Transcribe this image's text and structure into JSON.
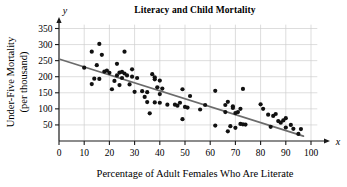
{
  "chart_data": {
    "type": "scatter",
    "title": "Literacy and Child Mortality",
    "xlabel": "Percentage of Adult Females Who Are Literate",
    "ylabel": "Under-Five Mortality (per thousand)",
    "ylabel_line1": "Under-Five Mortality",
    "ylabel_line2": "(per thousand)",
    "x_axis_name": "x",
    "y_axis_name": "y",
    "xlim": [
      0,
      103
    ],
    "ylim": [
      0,
      365
    ],
    "xticks": [
      0,
      10,
      20,
      30,
      40,
      50,
      60,
      70,
      80,
      90,
      100
    ],
    "yticks": [
      50,
      100,
      150,
      200,
      250,
      300,
      350
    ],
    "grid": true,
    "grid_color": "#cfcfcf",
    "point_color": "#111111",
    "point_radius": 2.1,
    "axis_color": "#1a1a1a",
    "trendline": {
      "label": "least-squares regression line",
      "color": "#6b6b6b",
      "x_start": 0,
      "y_start": 255,
      "x_end": 97,
      "y_end": 15
    },
    "points": [
      [
        10,
        228
      ],
      [
        13,
        278
      ],
      [
        13,
        177
      ],
      [
        14,
        194
      ],
      [
        15,
        236
      ],
      [
        16,
        302
      ],
      [
        16,
        193
      ],
      [
        17,
        268
      ],
      [
        18,
        216
      ],
      [
        19,
        219
      ],
      [
        20,
        212
      ],
      [
        21,
        161
      ],
      [
        22,
        187
      ],
      [
        23,
        240
      ],
      [
        23,
        204
      ],
      [
        24,
        213
      ],
      [
        24,
        174
      ],
      [
        25,
        215
      ],
      [
        25,
        196
      ],
      [
        26,
        278
      ],
      [
        26,
        210
      ],
      [
        27,
        204
      ],
      [
        28,
        176
      ],
      [
        29,
        223
      ],
      [
        29,
        200
      ],
      [
        30,
        153
      ],
      [
        31,
        196
      ],
      [
        33,
        155
      ],
      [
        34,
        137
      ],
      [
        35,
        152
      ],
      [
        35,
        121
      ],
      [
        36,
        86
      ],
      [
        37,
        208
      ],
      [
        38,
        198
      ],
      [
        38,
        192
      ],
      [
        38,
        120
      ],
      [
        39,
        167
      ],
      [
        40,
        188
      ],
      [
        40,
        146
      ],
      [
        40,
        119
      ],
      [
        41,
        163
      ],
      [
        43,
        113
      ],
      [
        46,
        113
      ],
      [
        47,
        110
      ],
      [
        48,
        119
      ],
      [
        49,
        161
      ],
      [
        49,
        68
      ],
      [
        50,
        106
      ],
      [
        51,
        104
      ],
      [
        52,
        140
      ],
      [
        56,
        98
      ],
      [
        58,
        112
      ],
      [
        62,
        156
      ],
      [
        62,
        48
      ],
      [
        66,
        112
      ],
      [
        66,
        90
      ],
      [
        67,
        30
      ],
      [
        67,
        122
      ],
      [
        68,
        46
      ],
      [
        69,
        103
      ],
      [
        69,
        108
      ],
      [
        70,
        41
      ],
      [
        70,
        87
      ],
      [
        71,
        90
      ],
      [
        72,
        100
      ],
      [
        72,
        53
      ],
      [
        73,
        162
      ],
      [
        73,
        52
      ],
      [
        74,
        51
      ],
      [
        80,
        114
      ],
      [
        81,
        100
      ],
      [
        83,
        82
      ],
      [
        84,
        44
      ],
      [
        85,
        78
      ],
      [
        86,
        84
      ],
      [
        87,
        62
      ],
      [
        88,
        57
      ],
      [
        89,
        64
      ],
      [
        90,
        71
      ],
      [
        90,
        42
      ],
      [
        92,
        50
      ],
      [
        93,
        38
      ],
      [
        95,
        22
      ],
      [
        96,
        37
      ]
    ]
  }
}
